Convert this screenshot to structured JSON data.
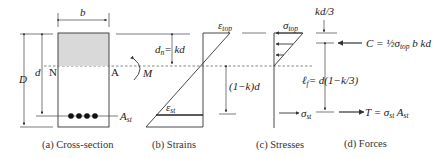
{
  "figure": {
    "colors": {
      "line": "#333333",
      "compression_zone": "#d9d9d9",
      "rebar": "#111111",
      "text": "#222222"
    },
    "panels": [
      {
        "id": "cross-section",
        "caption": "(a) Cross-section",
        "labels": {
          "width": "b",
          "total_depth": "D",
          "effective_depth": "d",
          "neutral_axis_left": "N",
          "neutral_axis_right": "A",
          "moment": "M",
          "steel_area": "A",
          "steel_area_sub": "st"
        },
        "rebar_count": 4
      },
      {
        "id": "strains",
        "caption": "(b) Strains",
        "labels": {
          "top_strain": "ε",
          "top_strain_sub": "top",
          "steel_strain": "ε",
          "steel_strain_sub": "st",
          "na_depth": "d",
          "na_depth_sub": "n",
          "na_depth_eq": "= kd",
          "below_na": "(1−k)d"
        }
      },
      {
        "id": "stresses",
        "caption": "(c) Stresses",
        "labels": {
          "top_stress": "σ",
          "top_stress_sub": "top",
          "steel_stress": "σ",
          "steel_stress_sub": "st"
        }
      },
      {
        "id": "forces",
        "caption": "(d) Forces",
        "labels": {
          "centroid_offset": "kd/3",
          "lever_arm": "ℓ",
          "lever_arm_sub": "f",
          "lever_arm_eq": "= d(1−k/3)",
          "compression_force": "C = ½σ",
          "compression_force_sub": "top",
          "compression_force_tail": " b kd",
          "tension_force": "T = σ",
          "tension_force_sub": "st",
          "tension_force_tail": " A",
          "tension_force_tail_sub": "st"
        }
      }
    ]
  }
}
